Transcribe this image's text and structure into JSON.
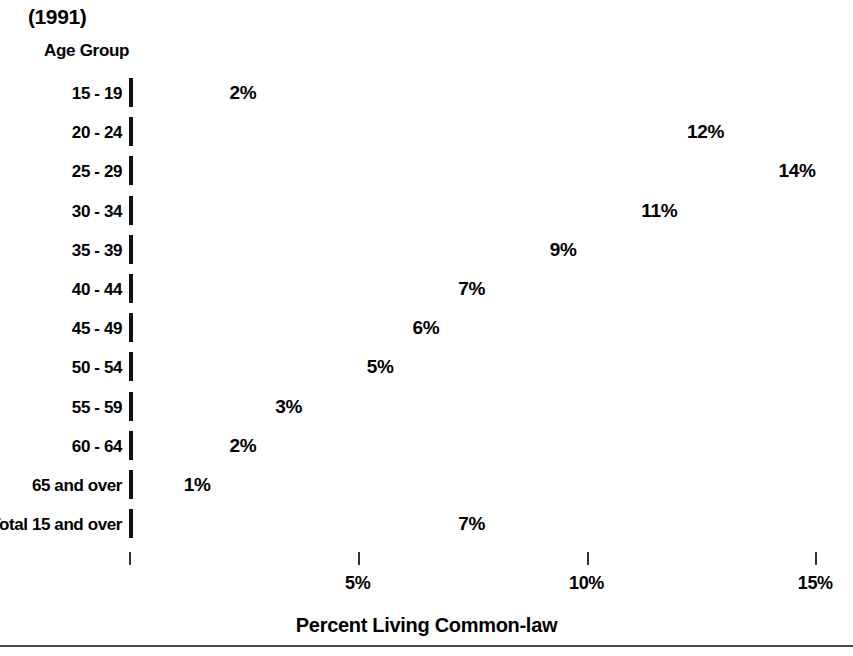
{
  "chart_data": {
    "type": "bar",
    "orientation": "horizontal",
    "title": "(1991)",
    "xlabel": "Percent Living Common-law",
    "ylabel": "Age Group",
    "xlim": [
      0,
      15
    ],
    "grid": false,
    "legend": null,
    "bar_color": "#808080",
    "bar_border_color": "#111111",
    "background_color": "#ffffff",
    "x_ticks": [
      {
        "value": 0,
        "label": ""
      },
      {
        "value": 5,
        "label": "5%"
      },
      {
        "value": 10,
        "label": "10%"
      },
      {
        "value": 15,
        "label": "15%"
      }
    ],
    "categories": [
      "15 - 19",
      "20 - 24",
      "25 - 29",
      "30 - 34",
      "35 - 39",
      "40 - 44",
      "45 - 49",
      "50 - 54",
      "55 - 59",
      "60 - 64",
      "65 and over",
      "Total 15 and over"
    ],
    "values": [
      2,
      12,
      14,
      11,
      9,
      7,
      6,
      5,
      3,
      2,
      1,
      7
    ],
    "data_labels": [
      "2%",
      "12%",
      "14%",
      "11%",
      "9%",
      "7%",
      "6%",
      "5%",
      "3%",
      "2%",
      "1%",
      "7%"
    ],
    "rows": [
      {
        "category": "15 - 19",
        "value": 2,
        "label": "2%"
      },
      {
        "category": "20 - 24",
        "value": 12,
        "label": "12%"
      },
      {
        "category": "25 - 29",
        "value": 14,
        "label": "14%"
      },
      {
        "category": "30 - 34",
        "value": 11,
        "label": "11%"
      },
      {
        "category": "35 - 39",
        "value": 9,
        "label": "9%"
      },
      {
        "category": "40 - 44",
        "value": 7,
        "label": "7%"
      },
      {
        "category": "45 - 49",
        "value": 6,
        "label": "6%"
      },
      {
        "category": "50 - 54",
        "value": 5,
        "label": "5%"
      },
      {
        "category": "55 - 59",
        "value": 3,
        "label": "3%"
      },
      {
        "category": "60 - 64",
        "value": 2,
        "label": "2%"
      },
      {
        "category": "65 and over",
        "value": 1,
        "label": "1%"
      },
      {
        "category": "Total 15 and over",
        "value": 7,
        "label": "7%"
      }
    ]
  }
}
